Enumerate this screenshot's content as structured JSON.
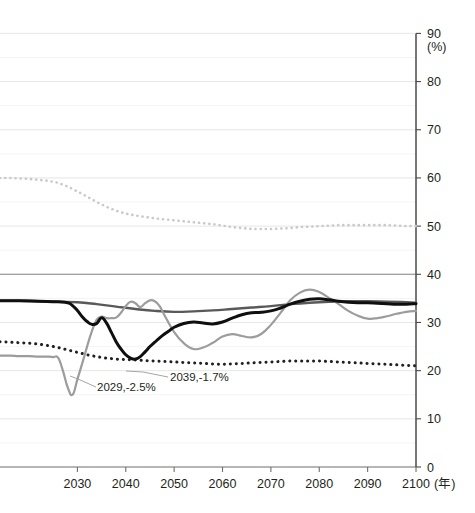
{
  "chart_data": {
    "type": "line",
    "title": "",
    "xlabel": "(年)",
    "ylabel": "(%)",
    "xlim": [
      2014,
      2100
    ],
    "ylim": [
      0,
      90
    ],
    "grid": true,
    "grid_step": 5,
    "legend_position": "none",
    "xticks": [
      "2030",
      "2040",
      "2050",
      "2060",
      "2070",
      "2080",
      "2090",
      "2100"
    ],
    "xtick_values": [
      2030,
      2040,
      2050,
      2060,
      2070,
      2080,
      2090,
      2100
    ],
    "yticks": [
      "0",
      "10",
      "20",
      "30",
      "40",
      "50",
      "60",
      "70",
      "80",
      "90"
    ],
    "ytick_values": [
      0,
      10,
      20,
      30,
      40,
      50,
      60,
      70,
      80,
      90
    ],
    "annotations": [
      {
        "label": "2029,-2.5%",
        "x": 2029,
        "y": 15.0,
        "text_x": 97,
        "text_y": 391,
        "leader": [
          [
            96,
            387
          ],
          [
            78,
            379
          ],
          [
            70,
            376
          ]
        ]
      },
      {
        "label": "2039,-1.7%",
        "x": 2039,
        "y": 22.5,
        "text_x": 170,
        "text_y": 381,
        "leader": [
          [
            168,
            377
          ],
          [
            143,
            372
          ],
          [
            126,
            371
          ]
        ]
      }
    ],
    "series": [
      {
        "name": "series-light-gray-dotted-high",
        "color": "#c9c9c9",
        "style": "dotted",
        "width": 2.6,
        "x": [
          2014,
          2016,
          2018,
          2020,
          2022,
          2024,
          2026,
          2028,
          2030,
          2032,
          2034,
          2036,
          2038,
          2040,
          2042,
          2044,
          2046,
          2048,
          2050,
          2052,
          2054,
          2056,
          2058,
          2060,
          2062,
          2064,
          2066,
          2068,
          2070,
          2072,
          2074,
          2076,
          2078,
          2080,
          2082,
          2084,
          2086,
          2088,
          2090,
          2092,
          2094,
          2096,
          2098,
          2100
        ],
        "y": [
          60.0,
          60.0,
          59.9,
          59.8,
          59.6,
          59.4,
          59.0,
          58.2,
          57.2,
          56.1,
          55.0,
          54.0,
          53.2,
          52.6,
          52.2,
          51.9,
          51.6,
          51.4,
          51.2,
          51.0,
          50.8,
          50.6,
          50.4,
          50.1,
          49.8,
          49.6,
          49.4,
          49.4,
          49.4,
          49.5,
          49.6,
          49.8,
          49.9,
          50.0,
          50.1,
          50.2,
          50.2,
          50.2,
          50.2,
          50.2,
          50.2,
          50.1,
          50.0,
          50.0
        ]
      },
      {
        "name": "series-black-dotted-low",
        "color": "#231f20",
        "style": "dotted",
        "width": 3.0,
        "x": [
          2014,
          2016,
          2018,
          2020,
          2022,
          2024,
          2026,
          2028,
          2030,
          2032,
          2034,
          2036,
          2038,
          2040,
          2042,
          2044,
          2046,
          2048,
          2050,
          2052,
          2054,
          2056,
          2058,
          2060,
          2062,
          2064,
          2066,
          2068,
          2070,
          2072,
          2074,
          2076,
          2078,
          2080,
          2082,
          2084,
          2086,
          2088,
          2090,
          2092,
          2094,
          2096,
          2098,
          2100
        ],
        "y": [
          26.0,
          25.9,
          25.8,
          25.7,
          25.5,
          25.2,
          24.8,
          24.3,
          23.8,
          23.3,
          22.9,
          22.6,
          22.4,
          22.3,
          22.2,
          22.1,
          22.0,
          21.9,
          21.8,
          21.7,
          21.6,
          21.5,
          21.4,
          21.3,
          21.4,
          21.5,
          21.6,
          21.7,
          21.8,
          21.9,
          22.0,
          22.0,
          22.0,
          22.0,
          21.9,
          21.8,
          21.7,
          21.6,
          21.5,
          21.4,
          21.3,
          21.2,
          21.1,
          21.0
        ]
      },
      {
        "name": "series-dark-gray-solid",
        "color": "#58595b",
        "style": "solid",
        "width": 2.4,
        "x": [
          2014,
          2018,
          2022,
          2026,
          2030,
          2034,
          2038,
          2042,
          2046,
          2050,
          2054,
          2058,
          2062,
          2066,
          2070,
          2074,
          2078,
          2082,
          2086,
          2090,
          2094,
          2098,
          2100
        ],
        "y": [
          34.5,
          34.5,
          34.4,
          34.3,
          34.2,
          33.8,
          33.3,
          32.8,
          32.4,
          32.2,
          32.3,
          32.5,
          32.8,
          33.1,
          33.4,
          33.8,
          34.1,
          34.3,
          34.4,
          34.4,
          34.3,
          34.2,
          34.1
        ]
      },
      {
        "name": "series-light-gray-solid",
        "color": "#9c9c9c",
        "style": "solid",
        "width": 2.2,
        "x": [
          2014,
          2016,
          2018,
          2020,
          2022,
          2024,
          2025,
          2026,
          2027,
          2028,
          2029,
          2030,
          2031,
          2032,
          2033,
          2034,
          2035,
          2036,
          2037,
          2038,
          2039,
          2040,
          2041,
          2042,
          2043,
          2044,
          2045,
          2046,
          2047,
          2048,
          2050,
          2052,
          2054,
          2056,
          2058,
          2060,
          2062,
          2064,
          2066,
          2068,
          2070,
          2072,
          2074,
          2076,
          2078,
          2080,
          2082,
          2084,
          2086,
          2088,
          2090,
          2092,
          2094,
          2096,
          2098,
          2100
        ],
        "y": [
          23.1,
          23.1,
          23.0,
          23.0,
          22.9,
          22.9,
          22.8,
          22.7,
          20.0,
          16.5,
          15.0,
          18.2,
          21.5,
          25.0,
          28.2,
          30.6,
          31.2,
          30.9,
          30.9,
          31.0,
          32.0,
          33.4,
          34.3,
          34.0,
          33.2,
          34.0,
          34.6,
          34.4,
          33.4,
          31.5,
          28.0,
          25.7,
          24.5,
          24.8,
          25.8,
          27.1,
          27.6,
          27.2,
          26.9,
          27.6,
          29.5,
          32.0,
          34.6,
          36.2,
          36.8,
          36.3,
          35.1,
          33.8,
          32.4,
          31.4,
          30.8,
          30.9,
          31.3,
          31.8,
          32.2,
          32.4
        ]
      },
      {
        "name": "series-black-solid",
        "color": "#0f0f0f",
        "style": "solid",
        "width": 3.0,
        "x": [
          2014,
          2018,
          2022,
          2026,
          2028,
          2029,
          2030,
          2031,
          2032,
          2033,
          2034,
          2035,
          2036,
          2037,
          2038,
          2039,
          2040,
          2041,
          2042,
          2043,
          2044,
          2045,
          2046,
          2047,
          2048,
          2049,
          2050,
          2052,
          2054,
          2056,
          2058,
          2060,
          2062,
          2064,
          2066,
          2068,
          2070,
          2072,
          2074,
          2076,
          2078,
          2080,
          2082,
          2084,
          2086,
          2088,
          2090,
          2092,
          2094,
          2096,
          2098,
          2100
        ],
        "y": [
          34.5,
          34.5,
          34.4,
          34.3,
          34.1,
          33.5,
          32.5,
          31.2,
          30.2,
          29.6,
          29.8,
          31.0,
          29.9,
          28.0,
          26.0,
          24.5,
          23.3,
          22.6,
          22.4,
          22.9,
          23.9,
          25.0,
          25.9,
          26.8,
          27.6,
          28.3,
          29.0,
          29.8,
          30.1,
          29.9,
          29.7,
          30.1,
          30.9,
          31.6,
          32.0,
          32.1,
          32.4,
          33.0,
          33.8,
          34.4,
          34.8,
          34.9,
          34.7,
          34.4,
          34.2,
          34.1,
          34.1,
          34.0,
          33.9,
          33.8,
          33.8,
          33.9
        ]
      }
    ]
  },
  "axes": {
    "y_unit_label": "(%)",
    "x_unit_label": "(年)"
  },
  "top_caption": ""
}
